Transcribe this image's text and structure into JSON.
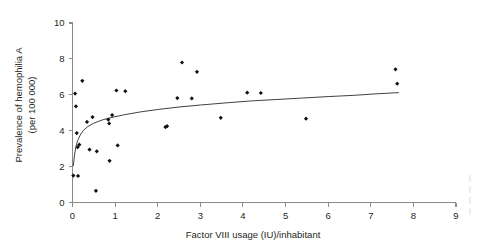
{
  "chart_data": {
    "type": "scatter",
    "title": "",
    "xlabel": "Factor VIII usage (IU)/inhabitant",
    "ylabel": "Prevalence of hemophilia A\n(per 100 000)",
    "ylabel_line1": "Prevalence of hemophilia A",
    "ylabel_line2": "(per 100 000)",
    "xlim": [
      0,
      9
    ],
    "ylim": [
      0,
      10
    ],
    "xticks": [
      0,
      1,
      2,
      3,
      4,
      5,
      6,
      7,
      8,
      9
    ],
    "yticks": [
      0,
      2,
      4,
      6,
      8,
      10
    ],
    "xtick_labels": [
      "0",
      "1",
      "2",
      "3",
      "4",
      "5",
      "6",
      "7",
      "8",
      "9"
    ],
    "ytick_labels": [
      "0",
      "2",
      "4",
      "6",
      "8",
      "10"
    ],
    "grid": false,
    "legend": null,
    "marker": "filled-diamond",
    "marker_color": "#111111",
    "points": [
      {
        "x": 0.02,
        "y": 1.5
      },
      {
        "x": 0.13,
        "y": 1.48
      },
      {
        "x": 0.06,
        "y": 6.07
      },
      {
        "x": 0.08,
        "y": 5.36
      },
      {
        "x": 0.1,
        "y": 3.87
      },
      {
        "x": 0.12,
        "y": 3.08
      },
      {
        "x": 0.16,
        "y": 3.22
      },
      {
        "x": 0.23,
        "y": 6.78
      },
      {
        "x": 0.34,
        "y": 4.49
      },
      {
        "x": 0.4,
        "y": 2.95
      },
      {
        "x": 0.47,
        "y": 4.76
      },
      {
        "x": 0.55,
        "y": 0.65
      },
      {
        "x": 0.57,
        "y": 2.85
      },
      {
        "x": 0.84,
        "y": 4.62
      },
      {
        "x": 0.86,
        "y": 4.4
      },
      {
        "x": 0.87,
        "y": 2.32
      },
      {
        "x": 0.93,
        "y": 4.87
      },
      {
        "x": 1.03,
        "y": 6.24
      },
      {
        "x": 1.06,
        "y": 3.18
      },
      {
        "x": 1.24,
        "y": 6.2
      },
      {
        "x": 2.18,
        "y": 4.2
      },
      {
        "x": 2.22,
        "y": 4.25
      },
      {
        "x": 2.46,
        "y": 5.82
      },
      {
        "x": 2.57,
        "y": 7.8
      },
      {
        "x": 2.8,
        "y": 5.8
      },
      {
        "x": 2.92,
        "y": 7.28
      },
      {
        "x": 3.48,
        "y": 4.72
      },
      {
        "x": 4.1,
        "y": 6.12
      },
      {
        "x": 4.42,
        "y": 6.1
      },
      {
        "x": 5.48,
        "y": 4.67
      },
      {
        "x": 7.58,
        "y": 7.42
      },
      {
        "x": 7.62,
        "y": 6.62
      }
    ],
    "fit_curve": {
      "label": "logarithmic fit",
      "points": [
        {
          "x": 0.02,
          "y": 2.05
        },
        {
          "x": 0.05,
          "y": 2.7
        },
        {
          "x": 0.08,
          "y": 3.1
        },
        {
          "x": 0.12,
          "y": 3.45
        },
        {
          "x": 0.18,
          "y": 3.75
        },
        {
          "x": 0.25,
          "y": 4.0
        },
        {
          "x": 0.35,
          "y": 4.22
        },
        {
          "x": 0.5,
          "y": 4.42
        },
        {
          "x": 0.7,
          "y": 4.6
        },
        {
          "x": 0.9,
          "y": 4.73
        },
        {
          "x": 1.2,
          "y": 4.88
        },
        {
          "x": 1.6,
          "y": 5.05
        },
        {
          "x": 2.0,
          "y": 5.18
        },
        {
          "x": 2.5,
          "y": 5.32
        },
        {
          "x": 3.0,
          "y": 5.43
        },
        {
          "x": 3.6,
          "y": 5.55
        },
        {
          "x": 4.2,
          "y": 5.66
        },
        {
          "x": 4.8,
          "y": 5.74
        },
        {
          "x": 5.4,
          "y": 5.82
        },
        {
          "x": 6.0,
          "y": 5.9
        },
        {
          "x": 6.6,
          "y": 5.97
        },
        {
          "x": 7.1,
          "y": 6.05
        },
        {
          "x": 7.65,
          "y": 6.12
        }
      ]
    }
  }
}
